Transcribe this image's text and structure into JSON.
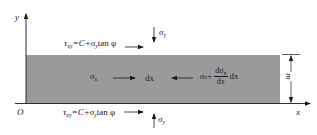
{
  "diagram": {
    "type": "soil element free-body diagram",
    "colors": {
      "band_fill": "#9a9a9a",
      "line": "#1a1a1a",
      "background": "#ffffff"
    },
    "axes": {
      "y_label": "y",
      "x_label": "x",
      "origin_label": "O"
    },
    "top_boundary": {
      "shear_label": "τ",
      "shear_sub": "xy",
      "shear_eq": "=C+σ",
      "shear_eq_sub": "y",
      "shear_tail": "tan φ",
      "normal_label": "σ",
      "normal_sub": "y"
    },
    "bottom_boundary": {
      "shear_label": "τ",
      "shear_sub": "xy",
      "shear_eq": "=C+σ",
      "shear_eq_sub": "y",
      "shear_tail": "tan φ",
      "normal_label": "σ",
      "normal_sub": "y"
    },
    "band": {
      "left_stress": "σ",
      "left_stress_sub": "x",
      "element_width": "dx",
      "right_stress": "σ",
      "right_stress_sub": "x",
      "right_plus": "+",
      "deriv_num": "dσ",
      "deriv_num_sub": "x",
      "deriv_den": "dx",
      "right_tail": "dx",
      "thickness_label": "m"
    }
  }
}
